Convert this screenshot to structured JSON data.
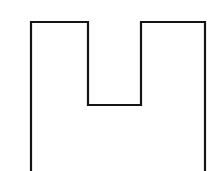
{
  "canvas": {
    "width": 217,
    "height": 171,
    "background_color": "#ffffff",
    "title": "Notched rectangle outline"
  },
  "figure": {
    "name": "notched-rectangle-outline",
    "stroke_color": "#151515",
    "stroke_width": 2.2,
    "fill": "none",
    "open_side": "bottom",
    "vertices": [
      {
        "label": "left-leg-bottom",
        "x": 31,
        "y": 171
      },
      {
        "label": "top-left-corner",
        "x": 31,
        "y": 22
      },
      {
        "label": "notch-top-left",
        "x": 88,
        "y": 22
      },
      {
        "label": "notch-bottom-left",
        "x": 88,
        "y": 105
      },
      {
        "label": "notch-bottom-right",
        "x": 141,
        "y": 105
      },
      {
        "label": "notch-top-right",
        "x": 141,
        "y": 22
      },
      {
        "label": "top-right-corner",
        "x": 205,
        "y": 22
      },
      {
        "label": "right-leg-bottom",
        "x": 205,
        "y": 171
      }
    ],
    "path": "M 31 171 L 31 22 L 88 22 L 88 105 L 141 105 L 141 22 L 205 22 L 205 171",
    "segments": [
      {
        "name": "left-outer-leg",
        "orientation": "vertical",
        "from": [
          31,
          171
        ],
        "to": [
          31,
          22
        ]
      },
      {
        "name": "top-edge-left",
        "orientation": "horizontal",
        "from": [
          31,
          22
        ],
        "to": [
          88,
          22
        ]
      },
      {
        "name": "notch-left-wall",
        "orientation": "vertical",
        "from": [
          88,
          22
        ],
        "to": [
          88,
          105
        ]
      },
      {
        "name": "notch-floor",
        "orientation": "horizontal",
        "from": [
          88,
          105
        ],
        "to": [
          141,
          105
        ]
      },
      {
        "name": "notch-right-wall",
        "orientation": "vertical",
        "from": [
          141,
          105
        ],
        "to": [
          141,
          22
        ]
      },
      {
        "name": "top-edge-right",
        "orientation": "horizontal",
        "from": [
          141,
          22
        ],
        "to": [
          205,
          22
        ]
      },
      {
        "name": "right-outer-leg",
        "orientation": "vertical",
        "from": [
          205,
          22
        ],
        "to": [
          205,
          171
        ]
      }
    ],
    "measurements": {
      "outer_width": 174,
      "notch_width": 53,
      "notch_depth": 83,
      "left_leg_width": 57,
      "right_leg_width": 64,
      "top_edge_y": 22
    }
  }
}
